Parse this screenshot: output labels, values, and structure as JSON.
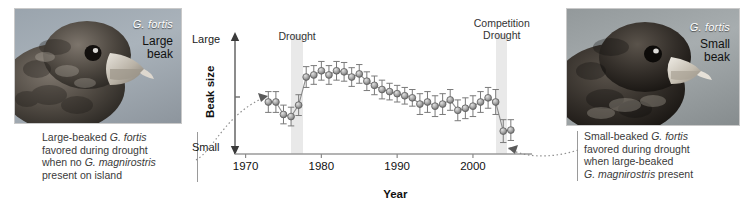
{
  "figure": {
    "left_photo": {
      "species_label": "G. fortis",
      "size_label_line1": "Large",
      "size_label_line2": "beak"
    },
    "right_photo": {
      "species_label": "G. fortis",
      "size_label_line1": "Small",
      "size_label_line2": "beak"
    },
    "left_caption": {
      "line1_a": "Large-beaked ",
      "line1_b": "G. fortis",
      "line2": "favored during drought",
      "line3_a": "when no ",
      "line3_b": "G. magnirostris",
      "line4": "present on island"
    },
    "right_caption": {
      "line1_a": "Small-beaked ",
      "line1_b": "G. fortis",
      "line2": "favored during drought",
      "line3": "when large-beaked",
      "line4_a": "G. magnirostris",
      "line4_b": " present"
    }
  },
  "chart_data": {
    "type": "line",
    "title": "",
    "xlabel": "Year",
    "ylabel": "Beak size",
    "y_top_label": "Large",
    "y_bottom_label": "Small",
    "xlim": [
      1969,
      2007
    ],
    "ylim": [
      0,
      1
    ],
    "grid": false,
    "legend_position": "none",
    "tick_labels_x": [
      "1970",
      "1980",
      "1990",
      "2000"
    ],
    "tick_values_x": [
      1970,
      1980,
      1990,
      2000
    ],
    "annotations": [
      {
        "label": "Drought",
        "start_year": 1976,
        "end_year": 1977.6,
        "shaded": true
      },
      {
        "label": "Competition\nDrought",
        "label_line1": "Competition",
        "label_line2": "Drought",
        "start_year": 2003,
        "end_year": 2004.5,
        "shaded": true
      }
    ],
    "series": [
      {
        "name": "Beak size",
        "marker": "circle-3d-gray",
        "error_bars": true,
        "x": [
          1973,
          1974,
          1975,
          1976,
          1977,
          1978,
          1979,
          1980,
          1981,
          1982,
          1983,
          1984,
          1985,
          1986,
          1987,
          1988,
          1989,
          1990,
          1991,
          1992,
          1993,
          1994,
          1995,
          1996,
          1997,
          1998,
          1999,
          2000,
          2001,
          2002,
          2003,
          2004,
          2005
        ],
        "values": [
          0.5,
          0.5,
          0.38,
          0.36,
          0.47,
          0.74,
          0.76,
          0.8,
          0.76,
          0.8,
          0.79,
          0.74,
          0.77,
          0.7,
          0.66,
          0.62,
          0.6,
          0.58,
          0.56,
          0.54,
          0.48,
          0.5,
          0.46,
          0.48,
          0.52,
          0.42,
          0.44,
          0.46,
          0.5,
          0.54,
          0.5,
          0.22,
          0.23
        ],
        "err": [
          0.1,
          0.1,
          0.09,
          0.09,
          0.1,
          0.1,
          0.09,
          0.09,
          0.09,
          0.09,
          0.09,
          0.09,
          0.09,
          0.09,
          0.09,
          0.09,
          0.08,
          0.08,
          0.08,
          0.08,
          0.1,
          0.1,
          0.1,
          0.1,
          0.1,
          0.1,
          0.1,
          0.1,
          0.1,
          0.1,
          0.12,
          0.11,
          0.1
        ]
      }
    ]
  }
}
